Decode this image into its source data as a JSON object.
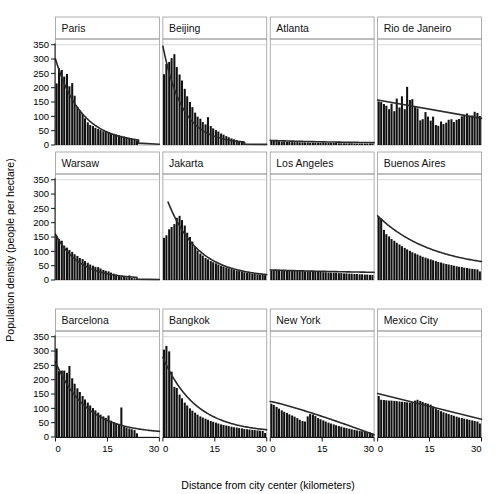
{
  "figure": {
    "ylabel": "Population density (people per hectare)",
    "xlabel": "Distance from city center (kilometers)",
    "ytick_labels": [
      "0",
      "50",
      "100",
      "150",
      "200",
      "250",
      "300",
      "350"
    ],
    "xtick_labels": [
      "0",
      "15",
      "30"
    ],
    "bar_color": "#111111",
    "fit_color": "#2a2a2a",
    "frame_color": "#9a9a9a",
    "grid_color": "#c9c9c9"
  },
  "chart_data": {
    "type": "bar",
    "title": "",
    "xlabel": "Distance from city center (kilometers)",
    "ylabel": "Population density (people per hectare)",
    "xlim": [
      0,
      30
    ],
    "ylim": [
      0,
      370
    ],
    "yticks": [
      0,
      50,
      100,
      150,
      200,
      250,
      300,
      350
    ],
    "xticks": [
      0,
      15,
      30
    ],
    "grid": "horizontal-at-350-only",
    "legend": "none",
    "layout": {
      "rows": 3,
      "cols": 4,
      "panel_order_rowwise": true
    },
    "bin_width_km": 0.75,
    "panels": [
      {
        "name": "Paris",
        "row": 0,
        "col": 0,
        "x": [
          0.4,
          1.1,
          1.9,
          2.6,
          3.4,
          4.1,
          4.9,
          5.6,
          6.4,
          7.1,
          7.9,
          8.6,
          9.4,
          10.1,
          10.9,
          11.6,
          12.4,
          13.1,
          13.9,
          14.6,
          15.4,
          16.1,
          16.9,
          17.6,
          18.4,
          19.1,
          19.9,
          20.6,
          21.4,
          22.1,
          22.9,
          23.6
        ],
        "values": [
          215,
          268,
          262,
          239,
          248,
          205,
          216,
          172,
          133,
          122,
          108,
          93,
          79,
          70,
          66,
          60,
          56,
          52,
          48,
          46,
          44,
          41,
          39,
          37,
          34,
          32,
          30,
          27,
          25,
          22,
          19,
          16
        ],
        "fit": {
          "type": "exponential",
          "y0": 300,
          "decay_per_km": 0.135,
          "x_end": 24.0,
          "tail_y": 6
        }
      },
      {
        "name": "Beijing",
        "row": 0,
        "col": 1,
        "x": [
          0.4,
          1.1,
          1.9,
          2.6,
          3.4,
          4.1,
          4.9,
          5.6,
          6.4,
          7.1,
          7.9,
          8.6,
          9.4,
          10.1,
          10.9,
          11.6,
          12.4,
          13.1,
          13.9,
          14.6,
          15.4,
          16.1,
          16.9,
          17.6,
          18.4,
          19.1,
          19.9,
          20.6,
          21.4,
          22.1,
          22.9,
          23.6
        ],
        "values": [
          247,
          283,
          290,
          303,
          317,
          272,
          246,
          225,
          196,
          170,
          150,
          132,
          113,
          99,
          92,
          80,
          72,
          97,
          66,
          58,
          52,
          47,
          40,
          36,
          31,
          27,
          23,
          20,
          17,
          14,
          12,
          10
        ],
        "fit": {
          "type": "exponential",
          "y0": 345,
          "decay_per_km": 0.175,
          "x_end": 23.5,
          "tail_y": 5
        }
      },
      {
        "name": "Atlanta",
        "row": 0,
        "col": 2,
        "x": [
          0.4,
          1.1,
          1.9,
          2.6,
          3.4,
          4.1,
          4.9,
          5.6,
          6.4,
          7.1,
          7.9,
          8.6,
          9.4,
          10.1,
          10.9,
          11.6,
          12.4,
          13.1,
          13.9,
          14.6,
          15.4,
          16.1,
          16.9,
          17.6,
          18.4,
          19.1,
          19.9,
          20.6,
          21.4,
          22.1,
          22.9,
          23.6,
          24.4,
          25.1,
          25.9,
          26.6,
          27.4,
          28.1,
          28.9,
          29.6
        ],
        "values": [
          17,
          15,
          14,
          13,
          12,
          12,
          11,
          11,
          10,
          10,
          10,
          9,
          9,
          9,
          9,
          8,
          8,
          8,
          8,
          8,
          8,
          7,
          7,
          7,
          7,
          7,
          6,
          6,
          6,
          6,
          6,
          6,
          5,
          5,
          5,
          5,
          5,
          5,
          5,
          5
        ],
        "fit": {
          "type": "exponential",
          "y0": 16,
          "decay_per_km": 0.04,
          "x_end": 30.0,
          "tail_y": 5
        }
      },
      {
        "name": "Rio de Janeiro",
        "row": 0,
        "col": 3,
        "x": [
          0.4,
          1.1,
          1.9,
          2.6,
          3.4,
          4.1,
          4.9,
          5.6,
          6.4,
          7.1,
          7.9,
          8.6,
          9.4,
          10.1,
          10.9,
          11.6,
          12.4,
          13.1,
          13.9,
          14.6,
          15.4,
          16.1,
          16.9,
          17.6,
          18.4,
          19.1,
          19.9,
          20.6,
          21.4,
          22.1,
          22.9,
          23.6,
          24.4,
          25.1,
          25.9,
          26.6,
          27.4,
          28.1,
          28.9,
          29.6
        ],
        "values": [
          152,
          150,
          143,
          137,
          125,
          144,
          118,
          162,
          131,
          170,
          125,
          203,
          157,
          160,
          136,
          128,
          86,
          90,
          115,
          99,
          85,
          99,
          70,
          67,
          82,
          73,
          78,
          88,
          90,
          80,
          88,
          91,
          100,
          104,
          110,
          99,
          103,
          116,
          112,
          101
        ],
        "fit": {
          "type": "linear",
          "y_start": 157,
          "y_end": 93,
          "x_start": 0.0,
          "x_end": 30.0
        }
      },
      {
        "name": "Warsaw",
        "row": 1,
        "col": 0,
        "x": [
          0.4,
          1.1,
          1.9,
          2.6,
          3.4,
          4.1,
          4.9,
          5.6,
          6.4,
          7.1,
          7.9,
          8.6,
          9.4,
          10.1,
          10.9,
          11.6,
          12.4,
          13.1,
          13.9,
          14.6,
          15.4,
          16.1,
          16.9,
          17.6,
          18.4,
          19.1,
          19.9,
          20.6,
          21.4,
          22.1,
          22.9,
          23.6
        ],
        "values": [
          154,
          143,
          137,
          120,
          113,
          105,
          98,
          90,
          84,
          77,
          73,
          66,
          60,
          54,
          50,
          46,
          45,
          40,
          35,
          32,
          30,
          26,
          22,
          19,
          16,
          13,
          11,
          9,
          16,
          7,
          6,
          5
        ],
        "fit": {
          "type": "exponential",
          "y0": 160,
          "decay_per_km": 0.145,
          "x_end": 23.5,
          "tail_y": 4
        }
      },
      {
        "name": "Jakarta",
        "row": 1,
        "col": 1,
        "x": [
          0.4,
          1.1,
          1.9,
          2.6,
          3.4,
          4.1,
          4.9,
          5.6,
          6.4,
          7.1,
          7.9,
          8.6,
          9.4,
          10.1,
          10.9,
          11.6,
          12.4,
          13.1,
          13.9,
          14.6,
          15.4,
          16.1,
          16.9,
          17.6,
          18.4,
          19.1,
          19.9,
          20.6,
          21.4,
          22.1,
          22.9,
          23.6,
          24.4,
          25.1,
          25.9,
          26.6,
          27.4,
          28.1,
          28.9,
          29.6
        ],
        "values": [
          147,
          156,
          177,
          185,
          195,
          217,
          224,
          209,
          190,
          165,
          150,
          134,
          115,
          103,
          92,
          85,
          77,
          72,
          66,
          62,
          58,
          54,
          50,
          47,
          44,
          41,
          38,
          35,
          33,
          31,
          29,
          27,
          25,
          24,
          22,
          21,
          20,
          19,
          18,
          17
        ],
        "fit": {
          "type": "exponential",
          "y0": 272,
          "decay_per_km": 0.115,
          "x_end": 30.0,
          "tail_y": 9,
          "x_start": 1.5
        }
      },
      {
        "name": "Los Angeles",
        "row": 1,
        "col": 2,
        "x": [
          0.4,
          1.1,
          1.9,
          2.6,
          3.4,
          4.1,
          4.9,
          5.6,
          6.4,
          7.1,
          7.9,
          8.6,
          9.4,
          10.1,
          10.9,
          11.6,
          12.4,
          13.1,
          13.9,
          14.6,
          15.4,
          16.1,
          16.9,
          17.6,
          18.4,
          19.1,
          19.9,
          20.6,
          21.4,
          22.1,
          22.9,
          23.6,
          24.4,
          25.1,
          25.9,
          26.6,
          27.4,
          28.1,
          28.9,
          29.6
        ],
        "values": [
          34,
          35,
          36,
          36,
          34,
          33,
          35,
          34,
          33,
          32,
          33,
          32,
          31,
          30,
          31,
          30,
          29,
          29,
          28,
          28,
          27,
          27,
          26,
          26,
          25,
          25,
          24,
          24,
          23,
          23,
          22,
          22,
          21,
          21,
          20,
          20,
          19,
          19,
          18,
          18
        ],
        "fit": {
          "type": "exponential",
          "y0": 35,
          "decay_per_km": 0.022,
          "x_end": 30.0,
          "tail_y": 18
        }
      },
      {
        "name": "Buenos Aires",
        "row": 1,
        "col": 3,
        "x": [
          0.4,
          1.1,
          1.9,
          2.6,
          3.4,
          4.1,
          4.9,
          5.6,
          6.4,
          7.1,
          7.9,
          8.6,
          9.4,
          10.1,
          10.9,
          11.6,
          12.4,
          13.1,
          13.9,
          14.6,
          15.4,
          16.1,
          16.9,
          17.6,
          18.4,
          19.1,
          19.9,
          20.6,
          21.4,
          22.1,
          22.9,
          23.6,
          24.4,
          25.1,
          25.9,
          26.6,
          27.4,
          28.1,
          28.9,
          29.6
        ],
        "values": [
          220,
          215,
          175,
          160,
          152,
          143,
          137,
          130,
          124,
          118,
          112,
          107,
          102,
          97,
          93,
          89,
          85,
          81,
          78,
          75,
          72,
          69,
          66,
          63,
          61,
          58,
          56,
          54,
          52,
          50,
          48,
          46,
          45,
          43,
          42,
          40,
          39,
          38,
          37,
          30
        ],
        "fit": {
          "type": "exponential",
          "y0": 224,
          "decay_per_km": 0.062,
          "x_end": 30.0,
          "tail_y": 35
        }
      },
      {
        "name": "Barcelona",
        "row": 2,
        "col": 0,
        "x": [
          0.4,
          1.1,
          1.9,
          2.6,
          3.4,
          4.1,
          4.9,
          5.6,
          6.4,
          7.1,
          7.9,
          8.6,
          9.4,
          10.1,
          10.9,
          11.6,
          12.4,
          13.1,
          13.9,
          14.6,
          15.4,
          16.1,
          16.9,
          17.6,
          18.4,
          19.1,
          19.9,
          20.6,
          21.4,
          22.1,
          22.9,
          23.6
        ],
        "values": [
          309,
          230,
          232,
          232,
          224,
          248,
          205,
          186,
          170,
          157,
          143,
          131,
          120,
          110,
          101,
          93,
          85,
          78,
          72,
          67,
          75,
          57,
          52,
          48,
          44,
          103,
          36,
          33,
          30,
          27,
          24,
          13
        ],
        "fit": {
          "type": "exponential",
          "y0": 262,
          "decay_per_km": 0.112,
          "x_end": 30.0,
          "tail_y": 11
        }
      },
      {
        "name": "Bangkok",
        "row": 2,
        "col": 1,
        "x": [
          0.4,
          1.1,
          1.9,
          2.6,
          3.4,
          4.1,
          4.9,
          5.6,
          6.4,
          7.1,
          7.9,
          8.6,
          9.4,
          10.1,
          10.9,
          11.6,
          12.4,
          13.1,
          13.9,
          14.6,
          15.4,
          16.1,
          16.9,
          17.6,
          18.4,
          19.1,
          19.9,
          20.6,
          21.4,
          22.1,
          22.9,
          23.6,
          24.4,
          25.1,
          25.9,
          26.6,
          27.4,
          28.1,
          28.9,
          29.6
        ],
        "values": [
          305,
          318,
          299,
          228,
          175,
          171,
          148,
          135,
          120,
          110,
          100,
          92,
          85,
          78,
          72,
          68,
          64,
          60,
          56,
          53,
          50,
          47,
          44,
          42,
          40,
          38,
          36,
          34,
          33,
          31,
          30,
          28,
          27,
          26,
          25,
          24,
          23,
          22,
          21,
          14
        ],
        "fit": {
          "type": "exponential",
          "y0": 278,
          "decay_per_km": 0.105,
          "x_end": 30.0,
          "tail_y": 14
        }
      },
      {
        "name": "New York",
        "row": 2,
        "col": 2,
        "x": [
          0.4,
          1.1,
          1.9,
          2.6,
          3.4,
          4.1,
          4.9,
          5.6,
          6.4,
          7.1,
          7.9,
          8.6,
          9.4,
          10.1,
          10.9,
          11.6,
          12.4,
          13.1,
          13.9,
          14.6,
          15.4,
          16.1,
          16.9,
          17.6,
          18.4,
          19.1,
          19.9,
          20.6,
          21.4,
          22.1,
          22.9,
          23.6,
          24.4,
          25.1,
          25.9,
          26.6,
          27.4,
          28.1,
          28.9,
          29.6
        ],
        "values": [
          116,
          112,
          105,
          99,
          93,
          88,
          84,
          79,
          75,
          71,
          66,
          60,
          56,
          54,
          72,
          80,
          78,
          73,
          66,
          62,
          58,
          54,
          50,
          47,
          44,
          41,
          38,
          36,
          33,
          31,
          29,
          27,
          25,
          23,
          21,
          20,
          18,
          17,
          16,
          12
        ],
        "fit": {
          "type": "linear",
          "y_start": 124,
          "y_end": 8,
          "x_start": 0.0,
          "x_end": 30.0,
          "curved": true
        }
      },
      {
        "name": "Mexico City",
        "row": 2,
        "col": 3,
        "x": [
          0.4,
          1.1,
          1.9,
          2.6,
          3.4,
          4.1,
          4.9,
          5.6,
          6.4,
          7.1,
          7.9,
          8.6,
          9.4,
          10.1,
          10.9,
          11.6,
          12.4,
          13.1,
          13.9,
          14.6,
          15.4,
          16.1,
          16.9,
          17.6,
          18.4,
          19.1,
          19.9,
          20.6,
          21.4,
          22.1,
          22.9,
          23.6,
          24.4,
          25.1,
          25.9,
          26.6,
          27.4,
          28.1,
          28.9,
          29.6
        ],
        "values": [
          143,
          130,
          129,
          128,
          127,
          127,
          126,
          125,
          124,
          123,
          122,
          121,
          120,
          122,
          127,
          130,
          126,
          122,
          119,
          116,
          113,
          107,
          100,
          94,
          90,
          86,
          83,
          80,
          77,
          74,
          71,
          68,
          66,
          64,
          62,
          60,
          58,
          56,
          54,
          47
        ],
        "fit": {
          "type": "linear",
          "y_start": 152,
          "y_end": 62,
          "x_start": 0.0,
          "x_end": 30.0
        }
      }
    ]
  }
}
